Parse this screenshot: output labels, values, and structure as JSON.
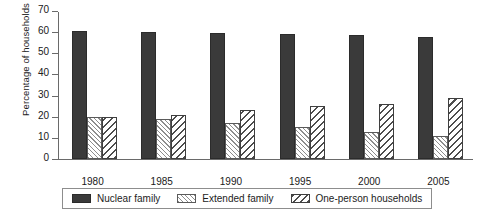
{
  "chart_data": {
    "type": "bar",
    "title": "",
    "subtitle": "",
    "xlabel": "",
    "ylabel": "Percentage of households",
    "categories": [
      "1980",
      "1985",
      "1990",
      "1995",
      "2000",
      "2005"
    ],
    "series": [
      {
        "name": "Nuclear family",
        "values": [
          60.5,
          60,
          59.5,
          59,
          58.5,
          57.5
        ]
      },
      {
        "name": "Extended family",
        "values": [
          20,
          19,
          17,
          15,
          13,
          11
        ]
      },
      {
        "name": "One-person households",
        "values": [
          20,
          21,
          23,
          25,
          26,
          29
        ]
      }
    ],
    "ylim": [
      0,
      70
    ],
    "yticks": [
      0,
      10,
      20,
      30,
      40,
      50,
      60,
      70
    ],
    "grid": false,
    "legend_position": "bottom",
    "legend_entries": [
      "Nuclear family",
      "Extended family",
      "One-person households"
    ]
  }
}
